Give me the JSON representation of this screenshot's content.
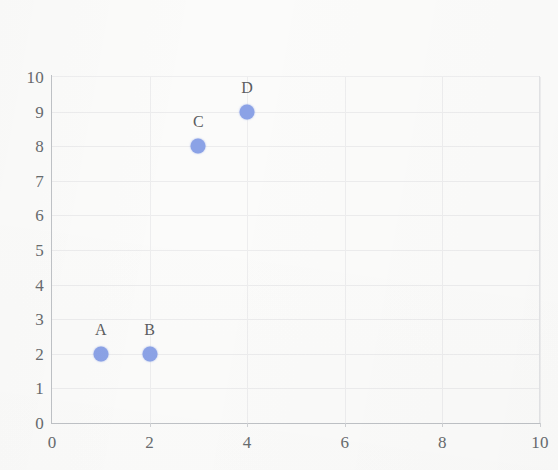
{
  "chart_data": {
    "type": "scatter",
    "title": "",
    "subtitle": "",
    "xlabel": "",
    "ylabel": "",
    "xlim": [
      0,
      10
    ],
    "ylim": [
      0,
      10
    ],
    "x_ticks": [
      0,
      2,
      4,
      6,
      8,
      10
    ],
    "y_ticks": [
      0,
      1,
      2,
      3,
      4,
      5,
      6,
      7,
      8,
      9,
      10
    ],
    "x_tick_labels": [
      "0",
      "2",
      "4",
      "6",
      "8",
      "10"
    ],
    "y_tick_labels": [
      "0",
      "1",
      "2",
      "3",
      "4",
      "5",
      "6",
      "7",
      "8",
      "9",
      "10"
    ],
    "grid": true,
    "grid_x_step": 2,
    "grid_y_step": 1,
    "legend": false,
    "legend_position": "none",
    "point_labels_position": "above",
    "marker_color": "#8ba2e6",
    "label_color": "#5b5d60",
    "tick_color": "#686b6e",
    "axis_color": "#bfc2c6",
    "grid_color": "#ececed",
    "background_color": "#fbfbfa",
    "points": [
      {
        "label": "A",
        "x": 1,
        "y": 2
      },
      {
        "label": "B",
        "x": 2,
        "y": 2
      },
      {
        "label": "C",
        "x": 3,
        "y": 8
      },
      {
        "label": "D",
        "x": 4,
        "y": 9
      }
    ]
  }
}
